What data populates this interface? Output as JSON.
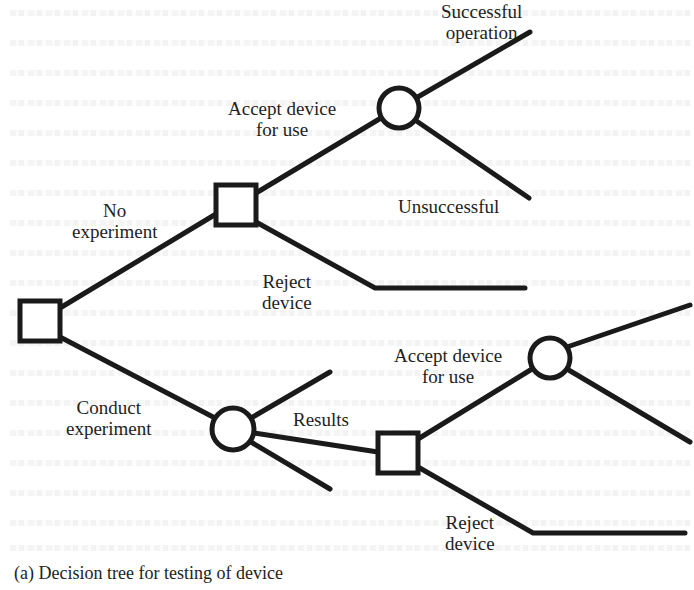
{
  "figure": {
    "caption": "(a) Decision tree for testing of device",
    "stroke_color": "#1a1a1a",
    "background_color": "#ffffff"
  },
  "nodes": [
    {
      "id": "root",
      "type": "decision",
      "shape": "square",
      "cx": 40,
      "cy": 321,
      "size": 40
    },
    {
      "id": "no-exp-decision",
      "type": "decision",
      "shape": "square",
      "cx": 236,
      "cy": 205,
      "size": 40
    },
    {
      "id": "no-exp-chance",
      "type": "chance",
      "shape": "circle",
      "cx": 399,
      "cy": 108,
      "r": 20
    },
    {
      "id": "exp-chance",
      "type": "chance",
      "shape": "circle",
      "cx": 233,
      "cy": 429,
      "r": 21
    },
    {
      "id": "results-decision",
      "type": "decision",
      "shape": "square",
      "cx": 398,
      "cy": 453,
      "size": 40
    },
    {
      "id": "exp-accept-chance",
      "type": "chance",
      "shape": "circle",
      "cx": 550,
      "cy": 358,
      "r": 20
    }
  ],
  "branches": [
    {
      "id": "no-experiment",
      "points": [
        [
          60,
          308
        ],
        [
          216,
          214
        ]
      ]
    },
    {
      "id": "conduct-experiment",
      "points": [
        [
          60,
          337
        ],
        [
          215,
          418
        ]
      ]
    },
    {
      "id": "accept-device-top",
      "points": [
        [
          256,
          193
        ],
        [
          381,
          118
        ]
      ]
    },
    {
      "id": "reject-device-top",
      "points": [
        [
          256,
          222
        ],
        [
          375,
          288
        ],
        [
          525,
          288
        ]
      ]
    },
    {
      "id": "successful-operation",
      "points": [
        [
          416,
          98
        ],
        [
          530,
          32
        ]
      ]
    },
    {
      "id": "unsuccessful",
      "points": [
        [
          415,
          120
        ],
        [
          529,
          198
        ]
      ]
    },
    {
      "id": "exp-result-upper",
      "points": [
        [
          251,
          418
        ],
        [
          330,
          372
        ]
      ]
    },
    {
      "id": "results",
      "points": [
        [
          254,
          433
        ],
        [
          378,
          452
        ]
      ]
    },
    {
      "id": "exp-result-lower",
      "points": [
        [
          251,
          442
        ],
        [
          330,
          489
        ]
      ]
    },
    {
      "id": "accept-device-bottom",
      "points": [
        [
          418,
          439
        ],
        [
          532,
          369
        ]
      ]
    },
    {
      "id": "reject-device-bottom",
      "points": [
        [
          418,
          467
        ],
        [
          533,
          533
        ],
        [
          685,
          533
        ]
      ]
    },
    {
      "id": "exp-accept-upper",
      "points": [
        [
          567,
          347
        ],
        [
          690,
          305
        ]
      ]
    },
    {
      "id": "exp-accept-lower",
      "points": [
        [
          567,
          369
        ],
        [
          690,
          442
        ]
      ]
    }
  ],
  "labels": {
    "successful_operation": {
      "line1": "Successful",
      "line2": "operation"
    },
    "accept_device_top": {
      "line1": "Accept device",
      "line2": "for use"
    },
    "no_experiment": {
      "line1": "No",
      "line2": "experiment"
    },
    "unsuccessful": {
      "line1": "Unsuccessful"
    },
    "reject_device_top": {
      "line1": "Reject",
      "line2": "device"
    },
    "conduct_experiment": {
      "line1": "Conduct",
      "line2": "experiment"
    },
    "results": {
      "line1": "Results"
    },
    "accept_device_bottom": {
      "line1": "Accept device",
      "line2": "for use"
    },
    "reject_device_bottom": {
      "line1": "Reject",
      "line2": "device"
    }
  }
}
